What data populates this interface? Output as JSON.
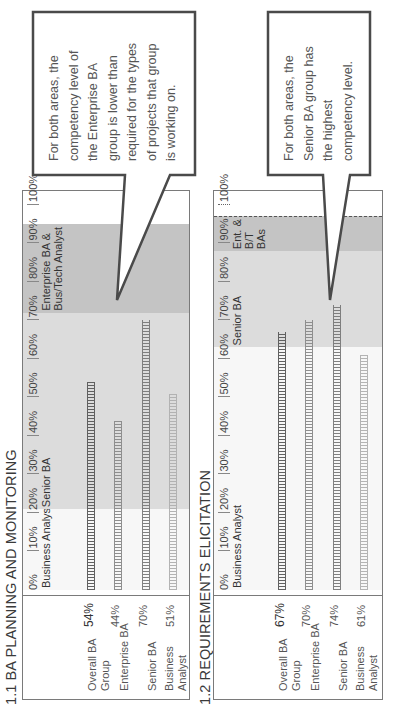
{
  "callouts": [
    {
      "text_lines": [
        "For both areas, the",
        "competency level of",
        "the Enterprise BA",
        "group is lower than",
        "required for the types",
        "of projects that group",
        "is working on."
      ]
    },
    {
      "text_lines": [
        "For both areas, the",
        "Senior BA group has",
        "the highest",
        "competency level."
      ]
    }
  ],
  "charts": [
    {
      "title": "1.1 BA PLANNING AND MONITORING",
      "ticks": [
        "0%",
        "10%",
        "20%",
        "30%",
        "40%",
        "50%",
        "60%",
        "70%",
        "80%",
        "90%",
        "100%"
      ],
      "bands": [
        {
          "label": "Business Analyst",
          "from": 0,
          "to": 21
        },
        {
          "label": "Senior BA",
          "from": 21,
          "to": 72
        },
        {
          "label_lines": [
            "Enterprise BA &",
            "Bus/Tech Analyst"
          ],
          "from": 72,
          "to": 95
        }
      ],
      "rows": [
        {
          "label_lines": [
            "Overall BA",
            "Group"
          ],
          "value": "54%"
        },
        {
          "label_lines": [
            "Enterprise BA"
          ],
          "value": "44%"
        },
        {
          "label_lines": [
            "Senior BA"
          ],
          "value": "70%"
        },
        {
          "label_lines": [
            "Business",
            "Analyst"
          ],
          "value": "51%"
        }
      ]
    },
    {
      "title": "1.2 REQUIREMENTS ELICITATION",
      "ticks": [
        "0%",
        "10%",
        "20%",
        "30%",
        "40%",
        "50%",
        "60%",
        "70%",
        "80%",
        "90%",
        "100%"
      ],
      "bands": [
        {
          "label": "Business Analyst",
          "from": 0,
          "to": 63
        },
        {
          "label": "Senior BA",
          "from": 63,
          "to": 88
        },
        {
          "label_lines": [
            "Ent. &",
            "B/T",
            "BAs"
          ],
          "from": 88,
          "to": 97
        }
      ],
      "rows": [
        {
          "label_lines": [
            "Overall BA",
            "Group"
          ],
          "value": "67%"
        },
        {
          "label_lines": [
            "Enterprise BA"
          ],
          "value": "70%"
        },
        {
          "label_lines": [
            "Senior BA"
          ],
          "value": "74%"
        },
        {
          "label_lines": [
            "Business",
            "Analyst"
          ],
          "value": "61%"
        }
      ]
    }
  ],
  "colors": {
    "band_business": "#f7f7f7",
    "band_senior": "#dcdcdc",
    "band_enterprise": "#c4c4c4",
    "bar_overall": "#5a5a5a",
    "bar_enterprise": "#8a8a8a",
    "bar_senior": "#7a7a7a",
    "bar_business": "#b0b0b0"
  },
  "chart_data": [
    {
      "type": "bar",
      "orientation": "horizontal",
      "title": "1.1 BA PLANNING AND MONITORING",
      "categories": [
        "Overall BA Group",
        "Enterprise BA",
        "Senior BA",
        "Business Analyst"
      ],
      "values": [
        54,
        44,
        70,
        51
      ],
      "value_labels": [
        "54%",
        "44%",
        "70%",
        "51%"
      ],
      "xlabel": "",
      "ylabel": "",
      "xlim": [
        0,
        100
      ],
      "x_ticks": [
        "0%",
        "10%",
        "20%",
        "30%",
        "40%",
        "50%",
        "60%",
        "70%",
        "80%",
        "90%",
        "100%"
      ],
      "reference_bands": [
        {
          "label": "Business Analyst",
          "range": [
            0,
            21
          ]
        },
        {
          "label": "Senior BA",
          "range": [
            21,
            72
          ]
        },
        {
          "label": "Enterprise BA & Bus/Tech Analyst",
          "range": [
            72,
            95
          ]
        }
      ],
      "annotation": "For both areas, the competency level of the Enterprise BA group is lower than required for the types of projects that group is working on.",
      "grid": false
    },
    {
      "type": "bar",
      "orientation": "horizontal",
      "title": "1.2 REQUIREMENTS ELICITATION",
      "categories": [
        "Overall BA Group",
        "Enterprise BA",
        "Senior BA",
        "Business Analyst"
      ],
      "values": [
        67,
        70,
        74,
        61
      ],
      "value_labels": [
        "67%",
        "70%",
        "74%",
        "61%"
      ],
      "xlabel": "",
      "ylabel": "",
      "xlim": [
        0,
        100
      ],
      "x_ticks": [
        "0%",
        "10%",
        "20%",
        "30%",
        "40%",
        "50%",
        "60%",
        "70%",
        "80%",
        "90%",
        "100%"
      ],
      "reference_bands": [
        {
          "label": "Business Analyst",
          "range": [
            0,
            63
          ]
        },
        {
          "label": "Senior BA",
          "range": [
            63,
            88
          ]
        },
        {
          "label": "Ent. & B/T BAs",
          "range": [
            88,
            97
          ]
        }
      ],
      "annotation": "For both areas, the Senior BA group has the highest competency level.",
      "grid": false
    }
  ]
}
